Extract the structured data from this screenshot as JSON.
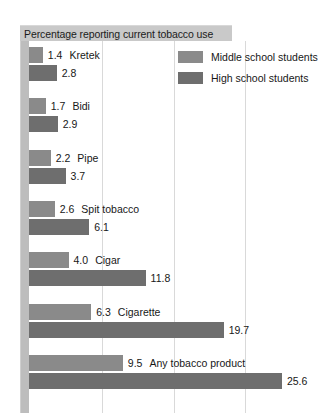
{
  "chart_data": {
    "type": "bar",
    "orientation": "horizontal",
    "title": "Percentage reporting current tobacco use",
    "xlabel": "",
    "ylabel": "",
    "xlim": [
      0,
      30
    ],
    "grid": true,
    "gridlines": [
      7.4,
      14.7,
      21.9
    ],
    "legend_position": "top-right",
    "categories": [
      "Kretek",
      "Bidi",
      "Pipe",
      "Spit tobacco",
      "Cigar",
      "Cigarette",
      "Any tobacco product"
    ],
    "series": [
      {
        "name": "Middle school students",
        "color": "#8a8a8a",
        "values": [
          1.4,
          1.7,
          2.2,
          2.6,
          4.0,
          6.3,
          9.5
        ],
        "labels": [
          "1.4",
          "1.7",
          "2.2",
          "2.6",
          "4.0",
          "6.3",
          "9.5"
        ]
      },
      {
        "name": "High school students",
        "color": "#6e6e6e",
        "values": [
          2.8,
          2.9,
          3.7,
          6.1,
          11.8,
          19.7,
          25.6
        ],
        "labels": [
          "2.8",
          "2.9",
          "3.7",
          "6.1",
          "11.8",
          "19.7",
          "25.6"
        ]
      }
    ]
  },
  "chart": {
    "title": "Percentage reporting current tobacco use",
    "title_bar_color": "#c9c9c9",
    "background": "#ffffff",
    "axis_band_color": "#bdbdbd",
    "gridline_color": "#d9d9d9"
  },
  "legend": {
    "items": [
      {
        "label": "Middle school students",
        "color": "#8a8a8a"
      },
      {
        "label": "High school students",
        "color": "#6e6e6e"
      }
    ]
  }
}
